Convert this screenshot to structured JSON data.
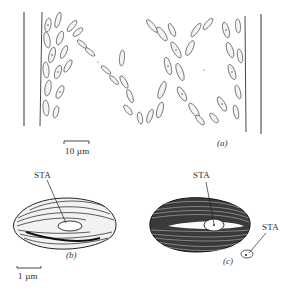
{
  "figure": {
    "panels": [
      {
        "id": "a",
        "label": "(a)",
        "description": "suspension of elongated cells between two boundary walls",
        "scale_bar": {
          "label": "10 µm"
        }
      },
      {
        "id": "b",
        "label": "(b)",
        "description": "spindle-shaped cell with longitudinal striations",
        "annotations": [
          {
            "text": "STA"
          }
        ],
        "scale_bar": {
          "label": "1 µm"
        }
      },
      {
        "id": "c",
        "label": "(c)",
        "description": "ellipsoidal cell with dense transverse striations",
        "annotations": [
          {
            "text": "STA"
          },
          {
            "text": "STA"
          }
        ]
      }
    ]
  },
  "colors": {
    "ink": "#2a2a2a",
    "background": "#ffffff"
  }
}
